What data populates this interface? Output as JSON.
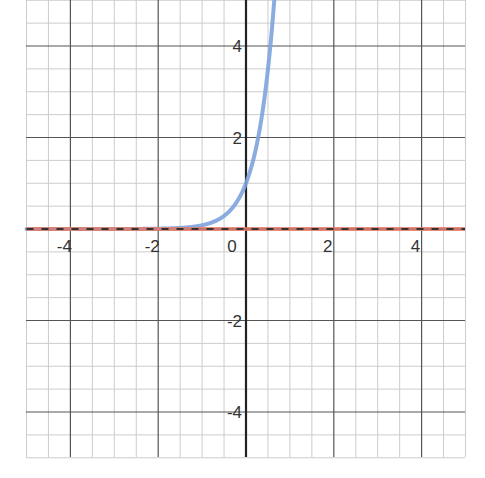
{
  "chart_data": {
    "type": "line",
    "title": "",
    "xlabel": "",
    "ylabel": "",
    "xlim": [
      -5,
      5
    ],
    "ylim": [
      -5,
      5
    ],
    "grid": true,
    "grid_minor_step": 0.5,
    "grid_major_step": 2,
    "x_ticks": [
      -4,
      -2,
      0,
      2,
      4
    ],
    "y_ticks": [
      4,
      2,
      -2,
      -4
    ],
    "x_tick_labels": [
      "-4",
      "-2",
      "0",
      "2",
      "4"
    ],
    "y_tick_labels": [
      "4",
      "2",
      "-2",
      "-4"
    ],
    "legend": null,
    "series": [
      {
        "name": "exponential curve",
        "style": "solid",
        "color": "#7ea3dd",
        "x": [
          -5,
          -4,
          -3,
          -2,
          -1.5,
          -1,
          -0.5,
          0,
          0.25,
          0.5,
          0.6,
          0.66
        ],
        "y": [
          0.0,
          0.0,
          0.001,
          0.007,
          0.024,
          0.082,
          0.287,
          1.0,
          1.87,
          3.49,
          4.48,
          5.2
        ]
      },
      {
        "name": "horizontal asymptote y = 0",
        "style": "solid",
        "color": "#e07a6a",
        "x": [
          -5,
          5
        ],
        "y": [
          0,
          0
        ]
      },
      {
        "name": "horizontal asymptote y = 0 (dashed)",
        "style": "dashed",
        "color": "#333333",
        "x": [
          -5,
          5
        ],
        "y": [
          0,
          0
        ]
      }
    ]
  },
  "colors": {
    "axis": "#222222",
    "major_grid": "#555555",
    "minor_grid": "#cccccc",
    "curve": "#7ea3dd",
    "asymptote": "#e07a6a",
    "dash": "#333333"
  }
}
